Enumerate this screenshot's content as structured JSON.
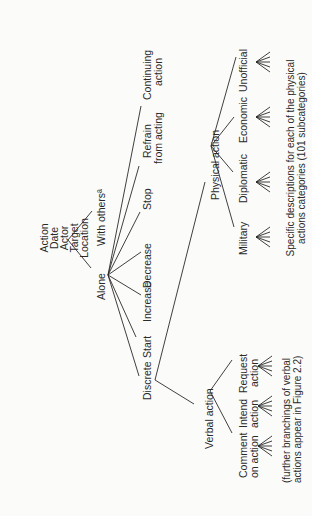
{
  "diagram": {
    "root_attributes": [
      "Action",
      "Date",
      "Actor",
      "Target",
      "Location"
    ],
    "level1": {
      "with_others": "With othersª",
      "alone": "Alone"
    },
    "alone_children": {
      "continuing": [
        "Continuing",
        "action"
      ],
      "refrain": [
        "Refrain",
        "from acting"
      ],
      "stop": "Stop",
      "decrease": "Decrease",
      "increase": "Increase",
      "start": "Start",
      "discrete": "Discrete"
    },
    "discrete_children": {
      "physical": "Physical action",
      "verbal": "Verbal action"
    },
    "physical_children": [
      "Military",
      "Diplomatic",
      "Economic",
      "Unofficial"
    ],
    "physical_note": [
      "Specific descriptions for each of the physical",
      "actions categories (101 subcategories)"
    ],
    "verbal_children": {
      "comment": [
        "Comment",
        "on action"
      ],
      "intend": [
        "Intend",
        "action"
      ],
      "request": [
        "Request",
        "action"
      ]
    },
    "verbal_note": [
      "(further branchings of verbal",
      "actions appear in Figure 2.2)"
    ]
  }
}
